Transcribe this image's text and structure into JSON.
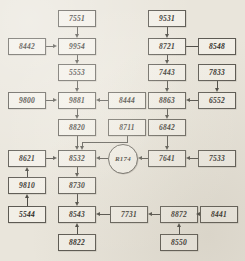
{
  "diagram": {
    "background_color": "#e9e5db",
    "node_fill_color": "#f2efe7",
    "line_color": "#4a4842",
    "nodes": [
      {
        "id": "n7551",
        "label": "7551",
        "shape": "rect",
        "x": 58,
        "y": 10,
        "w": 38,
        "h": 17
      },
      {
        "id": "n8442",
        "label": "8442",
        "shape": "rect",
        "x": 8,
        "y": 38,
        "w": 38,
        "h": 17
      },
      {
        "id": "n9954",
        "label": "9954",
        "shape": "rect",
        "x": 58,
        "y": 38,
        "w": 38,
        "h": 17
      },
      {
        "id": "n5553",
        "label": "5553",
        "shape": "rect",
        "x": 58,
        "y": 64,
        "w": 38,
        "h": 17
      },
      {
        "id": "n9800",
        "label": "9800",
        "shape": "rect",
        "x": 8,
        "y": 92,
        "w": 38,
        "h": 17
      },
      {
        "id": "n9881",
        "label": "9881",
        "shape": "rect",
        "x": 58,
        "y": 92,
        "w": 38,
        "h": 17
      },
      {
        "id": "n8444",
        "label": "8444",
        "shape": "rect",
        "x": 108,
        "y": 92,
        "w": 38,
        "h": 17
      },
      {
        "id": "n8820",
        "label": "8820",
        "shape": "rect",
        "x": 58,
        "y": 119,
        "w": 38,
        "h": 17
      },
      {
        "id": "n8711",
        "label": "8711",
        "shape": "rect",
        "x": 108,
        "y": 119,
        "w": 38,
        "h": 17
      },
      {
        "id": "n8621",
        "label": "8621",
        "shape": "rect",
        "x": 8,
        "y": 150,
        "w": 38,
        "h": 17
      },
      {
        "id": "n8532",
        "label": "8532",
        "shape": "rect",
        "x": 58,
        "y": 150,
        "w": 38,
        "h": 17
      },
      {
        "id": "nR174",
        "label": "R174",
        "shape": "circle",
        "x": 108,
        "y": 144,
        "w": 30,
        "h": 30
      },
      {
        "id": "n9810",
        "label": "9810",
        "shape": "rect",
        "x": 8,
        "y": 177,
        "w": 38,
        "h": 17
      },
      {
        "id": "n8730",
        "label": "8730",
        "shape": "rect",
        "x": 58,
        "y": 177,
        "w": 38,
        "h": 17
      },
      {
        "id": "n5544",
        "label": "5544",
        "shape": "rect",
        "x": 8,
        "y": 206,
        "w": 38,
        "h": 17
      },
      {
        "id": "n8543",
        "label": "8543",
        "shape": "rect",
        "x": 58,
        "y": 206,
        "w": 38,
        "h": 17
      },
      {
        "id": "n7731",
        "label": "7731",
        "shape": "rect",
        "x": 110,
        "y": 206,
        "w": 38,
        "h": 17
      },
      {
        "id": "n8822",
        "label": "8822",
        "shape": "rect",
        "x": 58,
        "y": 234,
        "w": 38,
        "h": 17
      },
      {
        "id": "n9531",
        "label": "9531",
        "shape": "rect",
        "x": 148,
        "y": 10,
        "w": 38,
        "h": 17
      },
      {
        "id": "n8721",
        "label": "8721",
        "shape": "rect",
        "x": 148,
        "y": 38,
        "w": 38,
        "h": 17
      },
      {
        "id": "n8548",
        "label": "8548",
        "shape": "rect",
        "x": 198,
        "y": 38,
        "w": 38,
        "h": 17
      },
      {
        "id": "n7443",
        "label": "7443",
        "shape": "rect",
        "x": 148,
        "y": 64,
        "w": 38,
        "h": 17
      },
      {
        "id": "n7833",
        "label": "7833",
        "shape": "rect",
        "x": 198,
        "y": 64,
        "w": 38,
        "h": 17
      },
      {
        "id": "n8863",
        "label": "8863",
        "shape": "rect",
        "x": 148,
        "y": 92,
        "w": 38,
        "h": 17
      },
      {
        "id": "n6552",
        "label": "6552",
        "shape": "rect",
        "x": 198,
        "y": 92,
        "w": 38,
        "h": 17
      },
      {
        "id": "n6842",
        "label": "6842",
        "shape": "rect",
        "x": 148,
        "y": 119,
        "w": 38,
        "h": 17
      },
      {
        "id": "n7641",
        "label": "7641",
        "shape": "rect",
        "x": 148,
        "y": 150,
        "w": 38,
        "h": 17
      },
      {
        "id": "n7533",
        "label": "7533",
        "shape": "rect",
        "x": 198,
        "y": 150,
        "w": 38,
        "h": 17
      },
      {
        "id": "n8872",
        "label": "8872",
        "shape": "rect",
        "x": 160,
        "y": 206,
        "w": 38,
        "h": 17
      },
      {
        "id": "n8441",
        "label": "8441",
        "shape": "rect",
        "x": 200,
        "y": 206,
        "w": 38,
        "h": 17
      },
      {
        "id": "n8550",
        "label": "8550",
        "shape": "rect",
        "x": 160,
        "y": 234,
        "w": 38,
        "h": 17
      }
    ],
    "edges": [
      {
        "from": "7551",
        "to": "9954",
        "direction": "down"
      },
      {
        "from": "8442",
        "to": "9954",
        "direction": "right"
      },
      {
        "from": "9954",
        "to": "5553",
        "direction": "down"
      },
      {
        "from": "5553",
        "to": "9881",
        "direction": "down"
      },
      {
        "from": "9800",
        "to": "9881",
        "direction": "right"
      },
      {
        "from": "8444",
        "to": "9881",
        "direction": "left"
      },
      {
        "from": "9881",
        "to": "8820",
        "direction": "down"
      },
      {
        "from": "8820",
        "to": "8532",
        "direction": "down"
      },
      {
        "from": "8711",
        "to": "8532",
        "direction": "down-left"
      },
      {
        "from": "8621",
        "to": "8532",
        "direction": "right"
      },
      {
        "from": "R174",
        "to": "8532",
        "direction": "left"
      },
      {
        "from": "9810",
        "to": "8621",
        "direction": "up"
      },
      {
        "from": "5544",
        "to": "9810",
        "direction": "up"
      },
      {
        "from": "8532",
        "to": "8730",
        "direction": "down"
      },
      {
        "from": "8730",
        "to": "8543",
        "direction": "down"
      },
      {
        "from": "8822",
        "to": "8543",
        "direction": "up"
      },
      {
        "from": "7731",
        "to": "8543",
        "direction": "left"
      },
      {
        "from": "8872",
        "to": "7731",
        "direction": "left"
      },
      {
        "from": "8441",
        "to": "8872",
        "direction": "left"
      },
      {
        "from": "8550",
        "to": "8872",
        "direction": "up"
      },
      {
        "from": "9531",
        "to": "8721",
        "direction": "down"
      },
      {
        "from": "8548",
        "to": "8721",
        "direction": "left"
      },
      {
        "from": "8721",
        "to": "7443",
        "direction": "down"
      },
      {
        "from": "7443",
        "to": "8863",
        "direction": "down"
      },
      {
        "from": "7833",
        "to": "6552",
        "direction": "down"
      },
      {
        "from": "6552",
        "to": "8863",
        "direction": "left"
      },
      {
        "from": "8863",
        "to": "6842",
        "direction": "down"
      },
      {
        "from": "6842",
        "to": "7641",
        "direction": "down"
      },
      {
        "from": "7533",
        "to": "7641",
        "direction": "left"
      },
      {
        "from": "7641",
        "to": "R174",
        "direction": "left"
      }
    ]
  }
}
